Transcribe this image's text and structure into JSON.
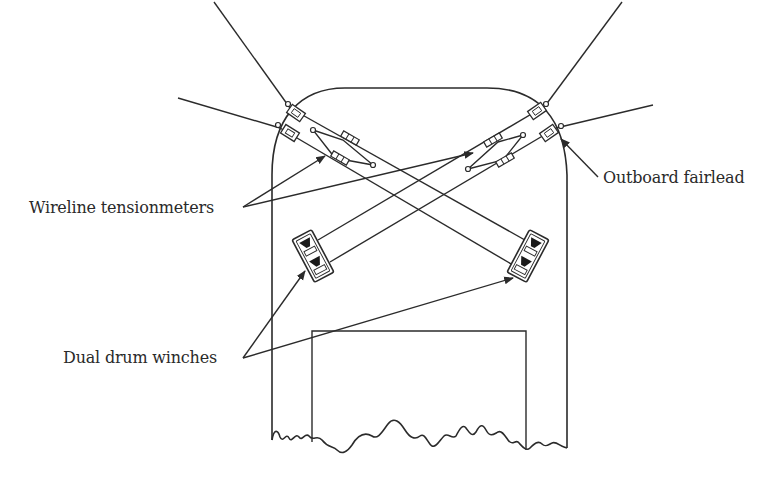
{
  "diagram": {
    "title": "",
    "labels": {
      "outboard_fairlead": "Outboard fairlead",
      "wireline_tensionmeters": "Wireline tensionmeters",
      "dual_drum_winches": "Dual drum winches"
    },
    "components": [
      {
        "id": "hull-outline",
        "type": "vessel-deck-outline"
      },
      {
        "id": "deckhouse",
        "type": "rectangle"
      },
      {
        "id": "fairlead-port-forward",
        "type": "fairlead"
      },
      {
        "id": "fairlead-port-aft",
        "type": "fairlead"
      },
      {
        "id": "fairlead-stbd-forward",
        "type": "fairlead"
      },
      {
        "id": "fairlead-stbd-aft",
        "type": "fairlead"
      },
      {
        "id": "tensionmeter-port",
        "type": "wireline-tensionmeter"
      },
      {
        "id": "tensionmeter-stbd",
        "type": "wireline-tensionmeter"
      },
      {
        "id": "winch-port",
        "type": "dual-drum-winch"
      },
      {
        "id": "winch-stbd",
        "type": "dual-drum-winch"
      }
    ],
    "colors": {
      "line": "#2b2b2b",
      "background": "#ffffff",
      "text": "#2a2a2a"
    }
  }
}
